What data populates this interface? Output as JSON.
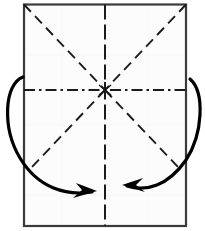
{
  "figure": {
    "title": "Origami fold diagram",
    "canvas": {
      "width": 205,
      "height": 231
    },
    "background_color": "#ffffff"
  },
  "paper": {
    "name": "paper-sheet",
    "fill_color": "#fcfcfc",
    "edge_color": "#3a3a3a",
    "edge_width": 2.2,
    "left": 24,
    "top": 4.5,
    "right": 186,
    "bottom": 226
  },
  "center_point": {
    "name": "center-crease-intersection",
    "x": 105,
    "y": 90,
    "color": "#1b1b1b"
  },
  "creases": [
    {
      "name": "horizontal-center-crease",
      "kind": "mountain",
      "style": "dash-dot",
      "color": "#1b1b1b",
      "width": 1.9,
      "dasharray": "11,4,2.5,4",
      "x1": 24,
      "y1": 90,
      "x2": 186,
      "y2": 90
    },
    {
      "name": "vertical-center-crease",
      "kind": "valley",
      "style": "dashed",
      "color": "#1b1b1b",
      "width": 2.0,
      "dasharray": "15,5",
      "x1": 105,
      "y1": 4.5,
      "x2": 105,
      "y2": 226
    },
    {
      "name": "diagonal-crease-top-left",
      "kind": "valley",
      "style": "dashed",
      "color": "#1b1b1b",
      "width": 1.9,
      "dasharray": "10,6",
      "x1": 24,
      "y1": 4.5,
      "x2": 105,
      "y2": 90
    },
    {
      "name": "diagonal-crease-top-right",
      "kind": "valley",
      "style": "dashed",
      "color": "#1b1b1b",
      "width": 1.9,
      "dasharray": "10,6",
      "x1": 186,
      "y1": 4.5,
      "x2": 105,
      "y2": 90
    },
    {
      "name": "diagonal-crease-bottom-left",
      "kind": "valley",
      "style": "dashed",
      "color": "#1b1b1b",
      "width": 1.9,
      "dasharray": "10,6",
      "x1": 105,
      "y1": 90,
      "x2": 32,
      "y2": 167
    },
    {
      "name": "diagonal-crease-bottom-right",
      "kind": "valley",
      "style": "dashed",
      "color": "#1b1b1b",
      "width": 1.9,
      "dasharray": "10,6",
      "x1": 105,
      "y1": 90,
      "x2": 178,
      "y2": 167
    }
  ],
  "arrows": [
    {
      "name": "fold-arrow-left",
      "direction": "left-edge-folds-to-bottom-center",
      "color": "#000000",
      "width": 3.2,
      "path": "M 23 77 C 4 84, 2 128, 20 158 C 38 188, 66 196, 92 192",
      "head": "M 97 191 L 76 183 L 82 190 L 73 198 Z"
    },
    {
      "name": "fold-arrow-right",
      "direction": "right-edge-folds-to-bottom-center",
      "color": "#000000",
      "width": 3.2,
      "path": "M 190 79 C 205 92, 203 134, 186 160 C 168 186, 146 192, 127 186",
      "head": "M 122 185 L 143 178 L 136 185 L 145 192 Z"
    }
  ]
}
